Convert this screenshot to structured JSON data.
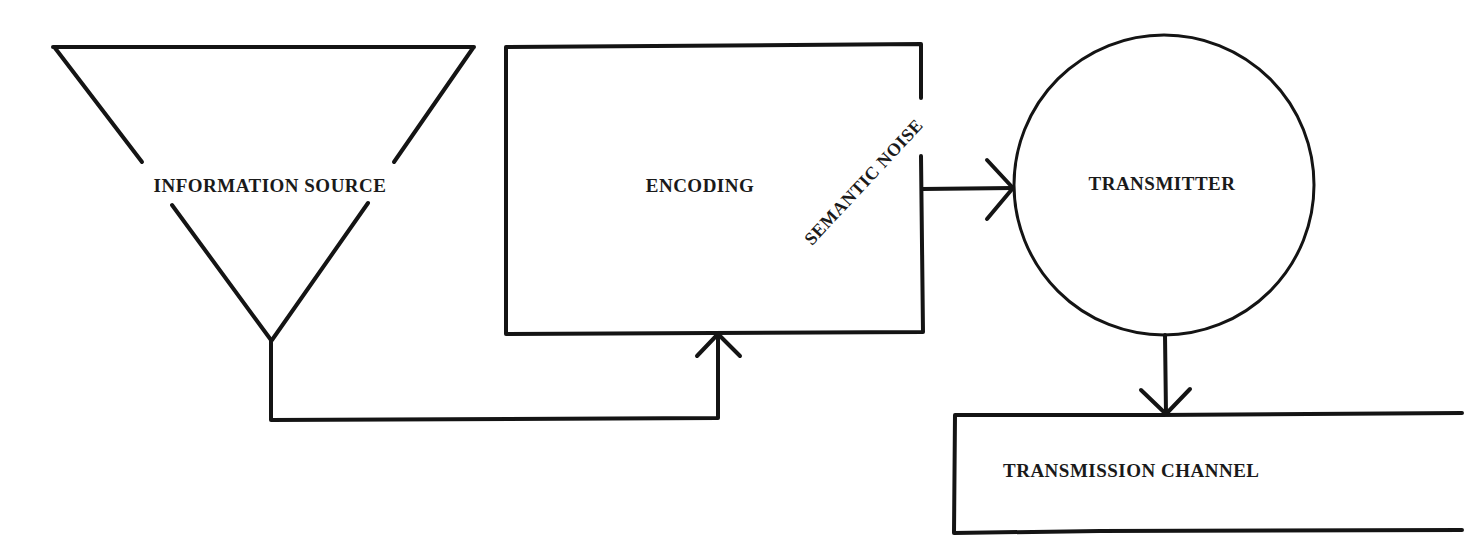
{
  "diagram": {
    "type": "communication-model",
    "nodes": [
      {
        "id": "information-source",
        "label": "INFORMATION SOURCE",
        "shape": "inverted-triangle"
      },
      {
        "id": "encoding",
        "label": "ENCODING",
        "shape": "rectangle"
      },
      {
        "id": "transmitter",
        "label": "TRANSMITTER",
        "shape": "circle"
      },
      {
        "id": "transmission-channel",
        "label": "TRANSMISSION CHANNEL",
        "shape": "rectangle"
      }
    ],
    "annotations": [
      {
        "id": "semantic-noise",
        "label": "SEMANTIC NOISE",
        "rotation_deg": -45
      }
    ],
    "edges": [
      {
        "from": "information-source",
        "to": "encoding"
      },
      {
        "from": "encoding",
        "to": "transmitter"
      },
      {
        "from": "transmitter",
        "to": "transmission-channel"
      }
    ],
    "colors": {
      "stroke": "#141414",
      "background": "#ffffff"
    }
  }
}
